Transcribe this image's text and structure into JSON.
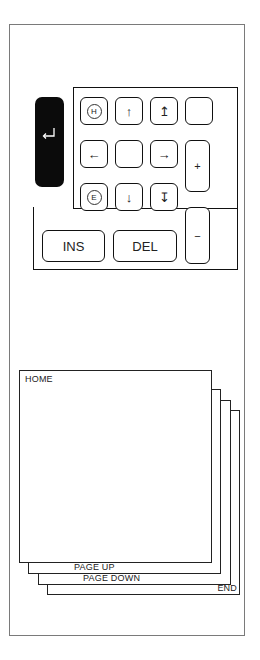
{
  "keypad": {
    "enter_key": {
      "icon": "enter-return-icon",
      "glyph": "↵"
    },
    "keys": [
      {
        "id": "home",
        "glyph": "H",
        "icon": "circled-h-icon"
      },
      {
        "id": "up",
        "glyph": "↑",
        "icon": "arrow-up-icon"
      },
      {
        "id": "page-up",
        "glyph": "↥",
        "icon": "arrow-up-bar-icon"
      },
      {
        "id": "blank-top-right",
        "glyph": ""
      },
      {
        "id": "left",
        "glyph": "←",
        "icon": "arrow-left-icon"
      },
      {
        "id": "center",
        "glyph": ""
      },
      {
        "id": "right",
        "glyph": "→",
        "icon": "arrow-right-icon"
      },
      {
        "id": "plus",
        "glyph": "+"
      },
      {
        "id": "end",
        "glyph": "E",
        "icon": "circled-e-icon"
      },
      {
        "id": "down",
        "glyph": "↓",
        "icon": "arrow-down-icon"
      },
      {
        "id": "page-down",
        "glyph": "↧",
        "icon": "arrow-down-bar-icon"
      },
      {
        "id": "minus",
        "glyph": "−"
      },
      {
        "id": "ins",
        "label": "INS"
      },
      {
        "id": "del",
        "label": "DEL"
      }
    ]
  },
  "pages": {
    "home": "HOME",
    "page_up": "PAGE UP",
    "page_down": "PAGE DOWN",
    "end": "END"
  }
}
